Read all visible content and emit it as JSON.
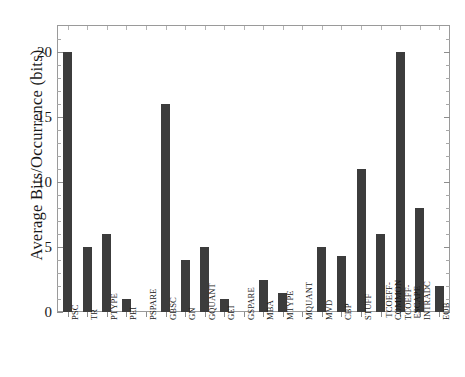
{
  "chart_data": {
    "type": "bar",
    "title": "",
    "xlabel": "",
    "ylabel": "Average Bits/Occurrence (bits)",
    "ylim": [
      0,
      22
    ],
    "yticks": [
      0,
      5,
      10,
      15,
      20
    ],
    "ytick_labels": [
      "0",
      "5",
      "10",
      "15",
      "20"
    ],
    "grid": false,
    "legend": null,
    "bar_color": "#3c3c3c",
    "frame_color": "#9a9a9a",
    "background": "#ffffff",
    "categories": [
      "PSC",
      "TR",
      "PTYPE",
      "PEI",
      "PSPARE",
      "GBSC",
      "GN",
      "GQUANT",
      "GEI",
      "GSPARE",
      "MBA",
      "MTYPE",
      "MQUANT",
      "MVD",
      "CBP",
      "STUFF",
      "TCOEFF-COMMON",
      "TCOEFF-ESCAPE",
      "INTRADC",
      "EOB"
    ],
    "values": [
      20,
      5,
      6,
      1,
      0,
      16,
      4,
      5,
      1,
      0,
      2.5,
      1.5,
      0,
      5,
      4.3,
      11,
      6,
      20,
      8,
      2
    ]
  }
}
